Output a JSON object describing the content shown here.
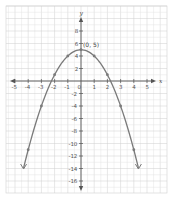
{
  "chart_data": {
    "type": "line",
    "title": "",
    "xlabel": "x",
    "ylabel": "y",
    "equation_implied": "y = 5 - x^2",
    "xlim": [
      -5.5,
      5.5
    ],
    "ylim": [
      -17,
      10.5
    ],
    "grid": true,
    "x_ticks": [
      -5,
      -4,
      -3,
      -2,
      -1,
      0,
      1,
      2,
      3,
      4,
      5
    ],
    "x_tick_labels": [
      "-5",
      "-4",
      "-3",
      "-2",
      "-1",
      "0",
      "1",
      "2",
      "3",
      "4",
      "5"
    ],
    "y_ticks": [
      8,
      6,
      4,
      2,
      -2,
      -4,
      -6,
      -8,
      -10,
      -12,
      -14,
      -16
    ],
    "y_tick_labels": [
      "8",
      "6",
      "4",
      "2",
      "-2",
      "-4",
      "-6",
      "-8",
      "-10",
      "-12",
      "-14",
      "-16"
    ],
    "series": [
      {
        "name": "parabola",
        "color": "#7a7a7a",
        "plotted_points": [
          {
            "x": -4,
            "y": -11
          },
          {
            "x": -3,
            "y": -4
          },
          {
            "x": -2,
            "y": 1
          },
          {
            "x": -1,
            "y": 4
          },
          {
            "x": 0,
            "y": 5
          },
          {
            "x": 1,
            "y": 4
          },
          {
            "x": 2,
            "y": 1
          },
          {
            "x": 3,
            "y": -4
          },
          {
            "x": 4,
            "y": -11
          }
        ],
        "end_arrows": true
      }
    ],
    "annotations": [
      {
        "text": "(0, 5)",
        "x": 0,
        "y": 5
      }
    ]
  },
  "colors": {
    "grid_minor": "#e4e4e4",
    "grid_major": "#cfcfcf",
    "axis": "#555555",
    "curve": "#7a7a7a"
  }
}
